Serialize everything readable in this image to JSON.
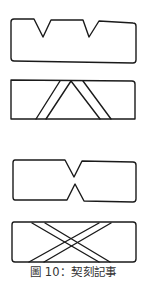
{
  "figure": {
    "caption": "圖 10：契刻記事",
    "stroke_color": "#1a1a1a",
    "caption_color": "#333333",
    "panels": [
      {
        "name": "double-v-notch-tally",
        "description": "tally with two V notches on top edge"
      },
      {
        "name": "parallel-inverted-v-tally",
        "description": "tally with inverted-V double-line band"
      },
      {
        "name": "hourglass-notch-tally",
        "description": "tally with opposing top and bottom notches"
      },
      {
        "name": "crossed-x-tally",
        "description": "tally with crossed X double-line bands"
      }
    ]
  }
}
